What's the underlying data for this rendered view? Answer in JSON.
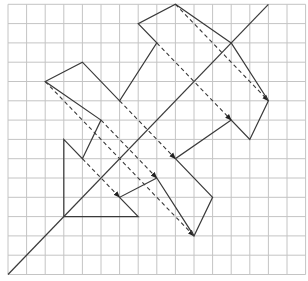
{
  "diagram": {
    "type": "reflection-on-grid",
    "canvas": {
      "width": 308,
      "height": 281,
      "background": "#ffffff"
    },
    "grid": {
      "origin_x": 8,
      "origin_y": 4.3,
      "cell_w": 18.6,
      "cell_h": 19.3,
      "cols": 16,
      "rows": 14,
      "color": "#c4c4c4"
    },
    "colors": {
      "line": "#3a3a3a",
      "arrow_head": "#222222"
    },
    "mirror_line": {
      "from": [
        0,
        14
      ],
      "to": [
        14,
        0
      ],
      "equation": "col + row = 14"
    },
    "original_shape": {
      "label": "object",
      "points": [
        [
          3,
          11
        ],
        [
          3,
          7
        ],
        [
          4,
          8
        ],
        [
          5,
          6
        ],
        [
          2,
          4
        ],
        [
          4,
          3
        ],
        [
          6,
          5
        ],
        [
          8,
          2
        ],
        [
          7,
          1
        ],
        [
          9,
          0
        ],
        [
          12,
          2
        ]
      ]
    },
    "reflected_shape": {
      "label": "image",
      "points": [
        [
          12,
          2
        ],
        [
          14,
          5
        ],
        [
          13,
          7
        ],
        [
          12,
          6
        ],
        [
          9,
          8
        ],
        [
          11,
          10
        ],
        [
          10,
          12
        ],
        [
          8,
          9
        ],
        [
          6,
          10
        ],
        [
          7,
          11
        ],
        [
          3,
          11
        ]
      ]
    },
    "reflection_arrows": [
      {
        "from": [
          9,
          0
        ],
        "to": [
          14,
          5
        ]
      },
      {
        "from": [
          8,
          2
        ],
        "to": [
          12,
          6
        ]
      },
      {
        "from": [
          6,
          5
        ],
        "to": [
          9,
          8
        ]
      },
      {
        "from": [
          5,
          6
        ],
        "to": [
          8,
          9
        ]
      },
      {
        "from": [
          2,
          4
        ],
        "to": [
          10,
          12
        ]
      },
      {
        "from": [
          4,
          8
        ],
        "to": [
          6,
          10
        ]
      }
    ]
  }
}
